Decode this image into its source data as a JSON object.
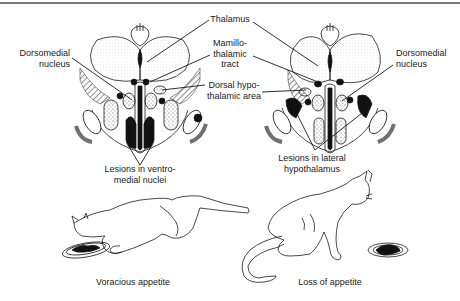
{
  "figure": {
    "labels": {
      "thalamus": "Thalamus",
      "mamillothalamic_tract": [
        "Mamillo-",
        "thalamic",
        "tract"
      ],
      "dorsal_hypothalamic_area": [
        "Dorsal hypo-",
        "thalamic area"
      ],
      "dorsomedial_left": [
        "Dorsomedial",
        "nucleus"
      ],
      "dorsomedial_right": [
        "Dorsomedial",
        "nucleus"
      ],
      "lesions_vmh": [
        "Lesions in ventro-",
        "medial nuclei"
      ],
      "lesions_lh": [
        "Lesions in lateral",
        "hypothalamus"
      ]
    },
    "captions": {
      "left_cat": "Voracious appetite",
      "right_cat": "Loss of appetite"
    },
    "colors": {
      "ink": "#1a1a1a",
      "paper": "#ffffff",
      "shade": "#d8d8d8",
      "rule": "#7a7a7a"
    }
  }
}
